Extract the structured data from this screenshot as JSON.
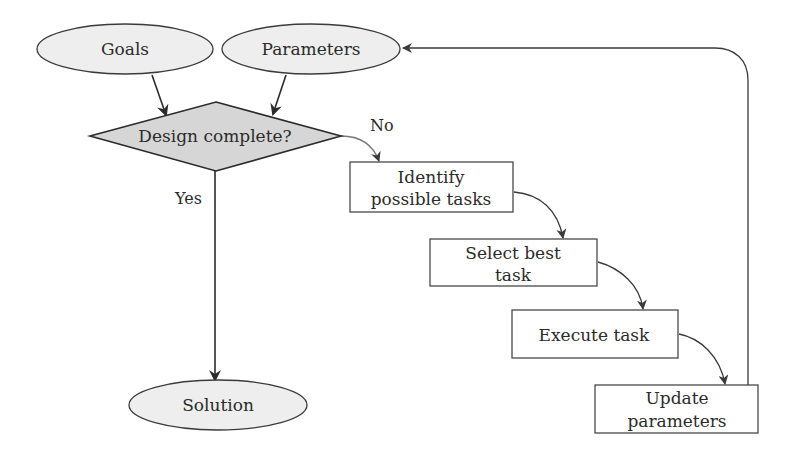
{
  "diagram": {
    "type": "flowchart",
    "colors": {
      "ellipse_fill": "#eeeeee",
      "diamond_fill": "#d6d6d6",
      "box_fill": "#ffffff",
      "stroke": "#3a3a3a",
      "text": "#2b2b2b"
    },
    "nodes": {
      "goals": {
        "shape": "ellipse",
        "label": "Goals"
      },
      "parameters": {
        "shape": "ellipse",
        "label": "Parameters"
      },
      "decision": {
        "shape": "diamond",
        "label": "Design complete?"
      },
      "identify": {
        "shape": "rectangle",
        "line1": "Identify",
        "line2": "possible tasks"
      },
      "select": {
        "shape": "rectangle",
        "line1": "Select best",
        "line2": "task"
      },
      "execute": {
        "shape": "rectangle",
        "label": "Execute task"
      },
      "update": {
        "shape": "rectangle",
        "line1": "Update",
        "line2": "parameters"
      },
      "solution": {
        "shape": "ellipse",
        "label": "Solution"
      }
    },
    "edges": [
      {
        "from": "goals",
        "to": "decision"
      },
      {
        "from": "parameters",
        "to": "decision"
      },
      {
        "from": "decision",
        "to": "identify",
        "label": "No"
      },
      {
        "from": "decision",
        "to": "solution",
        "label": "Yes"
      },
      {
        "from": "identify",
        "to": "select"
      },
      {
        "from": "select",
        "to": "execute"
      },
      {
        "from": "execute",
        "to": "update"
      },
      {
        "from": "update",
        "to": "parameters"
      }
    ],
    "edge_labels": {
      "no": "No",
      "yes": "Yes"
    }
  }
}
